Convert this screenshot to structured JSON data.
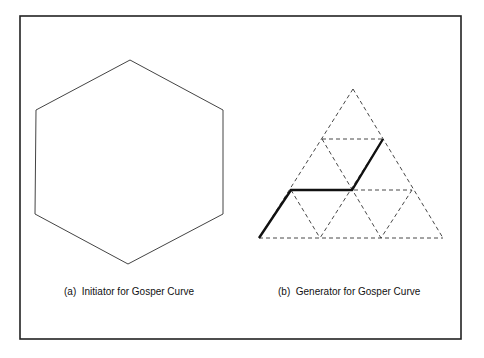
{
  "figure": {
    "panel_a": {
      "caption": "(a)  Initiator for Gosper Curve",
      "shape": "hexagon"
    },
    "panel_b": {
      "caption": "(b)  Generator for Gosper Curve",
      "shape": "triangular-grid-with-generator-path"
    },
    "colors": {
      "line": "#333333",
      "frame": "#222222",
      "background": "#ffffff"
    }
  }
}
